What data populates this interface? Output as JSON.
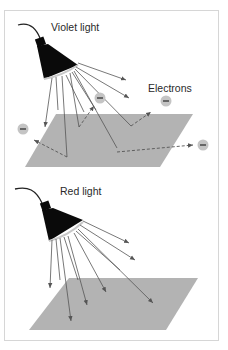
{
  "panels": [
    {
      "id": "violet",
      "title": "Violet light",
      "electron_label": "Electrons",
      "electron_count": 4,
      "emits_electrons": true
    },
    {
      "id": "red",
      "title": "Red light",
      "emits_electrons": false
    }
  ],
  "colors": {
    "frame_border": "#d6d6d6",
    "plate": "#b3b3b3",
    "lamp": "#0a0a0a",
    "ray": "#555555",
    "electron": "#c4c4c4",
    "electron_sign": "#333333",
    "text": "#2a2a2a"
  },
  "electron_symbol": "−"
}
